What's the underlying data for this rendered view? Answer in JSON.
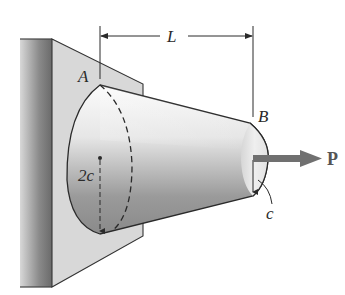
{
  "figure": {
    "type": "mechanics-diagram",
    "labels": {
      "length": "L",
      "point_a": "A",
      "point_b": "B",
      "diameter_a": "2c",
      "radius_b": "c",
      "force": "P"
    },
    "colors": {
      "wall_dark": "#6e6e6e",
      "wall_light": "#d4d4d4",
      "plate": "#d9d9d9",
      "cone_light": "#f2f2f2",
      "cone_dark": "#7a7a7a",
      "end_face": "#e6e6e6",
      "force_arrow": "#707070",
      "line": "#2a2a2a"
    }
  }
}
